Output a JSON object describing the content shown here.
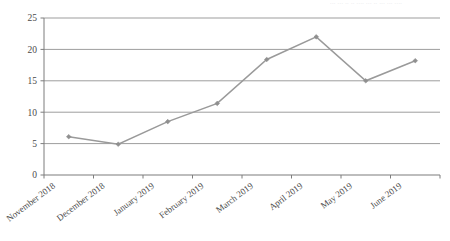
{
  "chart_data": {
    "type": "line",
    "title": "",
    "subtitle": "",
    "xlabel": "",
    "ylabel": "",
    "categories": [
      "November 2018",
      "December 2018",
      "January 2019",
      "February 2019",
      "March 2019",
      "April 2019",
      "May 2019",
      "June 2019"
    ],
    "series": [
      {
        "name": "",
        "values": [
          6.1,
          4.9,
          8.5,
          11.4,
          18.4,
          22.0,
          15.0,
          18.2
        ]
      }
    ],
    "ylim": [
      0,
      25
    ],
    "ytick_labels": [
      "0",
      "5",
      "10",
      "15",
      "20",
      "25"
    ],
    "ytick_values": [
      0,
      5,
      10,
      15,
      20,
      25
    ],
    "grid": "horizontal",
    "legend": "none",
    "marker": "diamond",
    "line_color": "#9a9a9a",
    "marker_color": "#8f8f8f",
    "grid_color": "#9d9d9d",
    "axis_color": "#7d7d7d",
    "annotations": []
  },
  "artifact": {
    "text": "... ... .. .. .... ... .. ... ... ...."
  }
}
